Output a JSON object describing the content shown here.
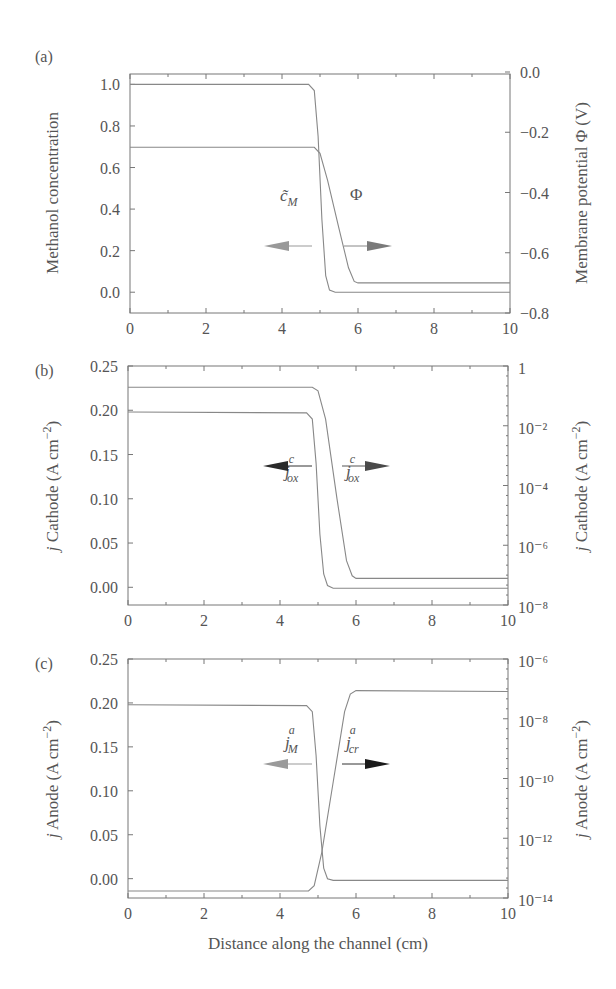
{
  "chart_data": [
    {
      "panel": "(a)",
      "type": "line",
      "xlabel": "",
      "ylabel": "Methanol concentration",
      "ylabel_right": "Membrane potential Φ (V)",
      "xlim": [
        0,
        10
      ],
      "ylim": [
        -0.1,
        1.05
      ],
      "ylim_right": [
        -0.8,
        0.0
      ],
      "x_ticks": [
        "0",
        "2",
        "4",
        "6",
        "8",
        "10"
      ],
      "y_ticks": [
        "0.0",
        "0.2",
        "0.4",
        "0.6",
        "0.8",
        "1.0"
      ],
      "y_ticks_right": [
        "0.0",
        "−0.2",
        "−0.4",
        "−0.6",
        "−0.8"
      ],
      "series": [
        {
          "name": "c̃_M",
          "axis": "left",
          "arrow": "left",
          "arrow_color": "#9a9a9a",
          "x": [
            0,
            4.7,
            4.85,
            4.95,
            5.05,
            5.15,
            5.25,
            5.4,
            10
          ],
          "values": [
            1.0,
            1.0,
            0.97,
            0.75,
            0.35,
            0.08,
            0.01,
            0.0,
            0.0
          ]
        },
        {
          "name": "Φ",
          "axis": "right",
          "arrow": "right",
          "arrow_color": "#7a7a7a",
          "x": [
            0,
            4.85,
            5.0,
            5.2,
            5.5,
            5.75,
            5.9,
            6.0,
            10
          ],
          "values": [
            -0.25,
            -0.25,
            -0.27,
            -0.36,
            -0.52,
            -0.65,
            -0.695,
            -0.7,
            -0.7
          ]
        }
      ],
      "annotations": [
        {
          "text": "c̃",
          "sub": "M",
          "x": 4.0,
          "y": 0.45
        },
        {
          "text": "Φ",
          "sub": "",
          "x": 5.95,
          "y": 0.45
        }
      ]
    },
    {
      "panel": "(b)",
      "type": "line",
      "xlabel": "",
      "ylabel": "j Cathode (A cm⁻²)",
      "ylabel_right": "j Cathode (A cm⁻²)",
      "xlim": [
        0,
        10
      ],
      "ylim": [
        -0.02,
        0.25
      ],
      "ylim_right_log10": [
        -8,
        0
      ],
      "x_ticks": [
        "0",
        "2",
        "4",
        "6",
        "8",
        "10"
      ],
      "y_ticks": [
        "0.00",
        "0.05",
        "0.10",
        "0.15",
        "0.20",
        "0.25"
      ],
      "y_ticks_right": [
        "1",
        "10⁻²",
        "10⁻⁴",
        "10⁻⁶",
        "10⁻⁸"
      ],
      "series": [
        {
          "name": "j_ox^c (linear)",
          "axis": "left",
          "arrow": "left",
          "arrow_color": "#2a2a2a",
          "x": [
            0,
            4.7,
            4.85,
            4.95,
            5.05,
            5.15,
            5.25,
            5.4,
            10
          ],
          "values": [
            0.198,
            0.197,
            0.19,
            0.14,
            0.06,
            0.015,
            0.002,
            -0.001,
            -0.001
          ]
        },
        {
          "name": "j_ox^c (log)",
          "axis": "left",
          "arrow": "right",
          "arrow_color": "#5a5a5a",
          "x": [
            0,
            4.85,
            5.0,
            5.2,
            5.5,
            5.75,
            5.9,
            6.0,
            10
          ],
          "values": [
            0.226,
            0.226,
            0.222,
            0.19,
            0.1,
            0.03,
            0.013,
            0.01,
            0.01
          ]
        }
      ],
      "annotations": [
        {
          "text": "j",
          "sup": "c",
          "sub": "ox",
          "x": 4.0,
          "y": 0.155
        },
        {
          "text": "j",
          "sup": "c",
          "sub": "ox",
          "x": 5.95,
          "y": 0.155
        }
      ]
    },
    {
      "panel": "(c)",
      "type": "line",
      "xlabel": "Distance along the channel (cm)",
      "ylabel": "j Anode (A cm⁻²)",
      "ylabel_right": "j Anode (A cm⁻²)",
      "xlim": [
        0,
        10
      ],
      "ylim": [
        -0.022,
        0.25
      ],
      "ylim_right_log10": [
        -14,
        -6
      ],
      "x_ticks": [
        "0",
        "2",
        "4",
        "6",
        "8",
        "10"
      ],
      "y_ticks": [
        "0.00",
        "0.05",
        "0.10",
        "0.15",
        "0.20",
        "0.25"
      ],
      "y_ticks_right": [
        "10⁻⁶",
        "10⁻⁸",
        "10⁻¹⁰",
        "10⁻¹²",
        "10⁻¹⁴"
      ],
      "series": [
        {
          "name": "j_M^a",
          "axis": "left",
          "arrow": "left",
          "arrow_color": "#9a9a9a",
          "x": [
            0,
            4.7,
            4.85,
            4.95,
            5.05,
            5.15,
            5.25,
            5.4,
            10
          ],
          "values": [
            0.198,
            0.197,
            0.19,
            0.14,
            0.06,
            0.012,
            0.0,
            -0.002,
            -0.002
          ]
        },
        {
          "name": "j_cr^a",
          "axis": "right",
          "arrow": "right",
          "arrow_color": "#1a1a1a",
          "x": [
            0,
            4.75,
            4.9,
            5.1,
            5.4,
            5.7,
            5.85,
            6.0,
            10
          ],
          "values": [
            -0.014,
            -0.014,
            -0.008,
            0.03,
            0.11,
            0.19,
            0.21,
            0.214,
            0.213
          ]
        }
      ],
      "annotations": [
        {
          "text": "j",
          "sup": "a",
          "sub": "M",
          "x": 4.0,
          "y": 0.14
        },
        {
          "text": "j",
          "sup": "a",
          "sub": "cr",
          "x": 5.95,
          "y": 0.14
        }
      ]
    }
  ],
  "panels": {
    "a": {
      "label": "(a)",
      "ylabel": "Methanol concentration",
      "ylabel_right": "Membrane potential Φ (V)",
      "anno_left": "c̃",
      "anno_left_sub": "M",
      "anno_right": "Φ"
    },
    "b": {
      "label": "(b)",
      "ylabel_j": "j",
      "ylabel": " Cathode (A cm",
      "ylabel_exp": "−2",
      "ylabel_close": ")",
      "anno_main": "j",
      "anno_sup": "c",
      "anno_sub": "ox"
    },
    "c": {
      "label": "(c)",
      "ylabel_j": "j",
      "ylabel": " Anode (A cm",
      "ylabel_exp": "−2",
      "ylabel_close": ")",
      "anno_main": "j",
      "anno_sup": "a",
      "anno_left_sub": "M",
      "anno_right_sub": "cr"
    }
  },
  "xlabel": "Distance along the channel (cm)",
  "colors": {
    "curve": "#888888",
    "frame": "#777777",
    "text": "#555555"
  }
}
